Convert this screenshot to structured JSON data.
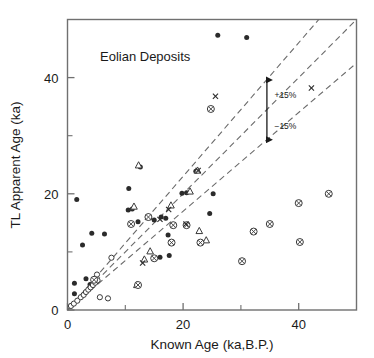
{
  "chart_data": {
    "type": "scatter",
    "title": "Eolian Deposits",
    "xlabel": "Known Age (ka,B.P.)",
    "ylabel": "TL Apparent Age (ka)",
    "xlim": [
      0,
      50
    ],
    "ylim": [
      0,
      50
    ],
    "xticks": [
      0,
      20,
      40
    ],
    "xticklabels": [
      "0",
      "20",
      "40"
    ],
    "xminorticks": [
      10,
      30
    ],
    "yticks": [
      0,
      20,
      40
    ],
    "yticklabels": [
      "0",
      "20",
      "40"
    ],
    "yminorticks": [
      10,
      30
    ],
    "grid": false,
    "legend": "none",
    "reference_lines": [
      {
        "name": "one-to-one",
        "slope": 1.0,
        "intercept": 0,
        "style": "dashed"
      },
      {
        "name": "plus-15-percent",
        "slope": 1.15,
        "intercept": 0,
        "style": "dashed"
      },
      {
        "name": "minus-15-percent",
        "slope": 0.85,
        "intercept": 0,
        "style": "dashed"
      }
    ],
    "annotations": [
      {
        "name": "plus-15-label",
        "text": "+15%",
        "x": 35.8,
        "y": 36.5
      },
      {
        "name": "minus-15-label",
        "text": "−15%",
        "x": 35.8,
        "y": 31.2
      },
      {
        "name": "error-arrow",
        "text": "",
        "x": 34.5,
        "y_top": 39.6,
        "y_bottom": 29.3
      }
    ],
    "series": [
      {
        "name": "filled-circle",
        "marker": "filled-circle",
        "points": [
          [
            1.2,
            4.6
          ],
          [
            1.2,
            2.8
          ],
          [
            1.6,
            19.0
          ],
          [
            2.6,
            11.2
          ],
          [
            3.2,
            5.4
          ],
          [
            3.9,
            4.4
          ],
          [
            4.4,
            4.4
          ],
          [
            4.2,
            13.2
          ],
          [
            6.4,
            13.1
          ],
          [
            10.6,
            20.9
          ],
          [
            10.5,
            17.2
          ],
          [
            11.2,
            17.4
          ],
          [
            12.2,
            15.2
          ],
          [
            12.6,
            24.6
          ],
          [
            15.0,
            15.5
          ],
          [
            16.2,
            16.0
          ],
          [
            17.0,
            15.8
          ],
          [
            17.4,
            12.9
          ],
          [
            16.0,
            9.1
          ],
          [
            17.6,
            9.4
          ],
          [
            19.8,
            20.1
          ],
          [
            20.6,
            20.2
          ],
          [
            22.2,
            23.9
          ],
          [
            24.6,
            16.6
          ],
          [
            25.2,
            20.0
          ],
          [
            26.0,
            47.3
          ],
          [
            31.0,
            46.9
          ]
        ]
      },
      {
        "name": "open-circle",
        "marker": "open-circle",
        "points": [
          [
            0.6,
            0.7
          ],
          [
            1.1,
            1.1
          ],
          [
            1.7,
            1.6
          ],
          [
            2.3,
            2.2
          ],
          [
            2.8,
            2.6
          ],
          [
            3.2,
            3.1
          ],
          [
            3.6,
            3.5
          ],
          [
            4.0,
            3.9
          ],
          [
            4.4,
            4.3
          ],
          [
            4.8,
            4.7
          ],
          [
            5.2,
            5.1
          ],
          [
            5.1,
            6.1
          ],
          [
            5.6,
            2.2
          ],
          [
            7.0,
            2.0
          ],
          [
            7.6,
            9.0
          ]
        ]
      },
      {
        "name": "open-triangle",
        "marker": "open-triangle",
        "points": [
          [
            11.5,
            17.8
          ],
          [
            12.3,
            24.9
          ],
          [
            14.0,
            16.0
          ],
          [
            13.3,
            8.7
          ],
          [
            14.3,
            10.1
          ],
          [
            17.9,
            18.0
          ],
          [
            21.2,
            20.4
          ],
          [
            22.5,
            24.0
          ],
          [
            22.8,
            13.6
          ],
          [
            24.0,
            12.0
          ],
          [
            12.0,
            4.3
          ]
        ]
      },
      {
        "name": "crossed-circle",
        "marker": "crossed-circle",
        "points": [
          [
            4.6,
            5.2
          ],
          [
            11.0,
            14.8
          ],
          [
            12.2,
            4.3
          ],
          [
            14.0,
            16.0
          ],
          [
            15.0,
            8.9
          ],
          [
            18.0,
            11.6
          ],
          [
            18.3,
            14.6
          ],
          [
            20.6,
            14.6
          ],
          [
            23.0,
            11.6
          ],
          [
            24.8,
            34.6
          ],
          [
            30.2,
            8.4
          ],
          [
            32.2,
            13.5
          ],
          [
            35.0,
            14.8
          ],
          [
            40.0,
            18.4
          ],
          [
            40.2,
            11.7
          ],
          [
            45.2,
            20.0
          ]
        ]
      },
      {
        "name": "x-mark",
        "marker": "x",
        "points": [
          [
            13.0,
            8.1
          ],
          [
            16.0,
            15.6
          ],
          [
            17.5,
            17.3
          ],
          [
            20.5,
            14.8
          ],
          [
            22.6,
            24.0
          ],
          [
            42.2,
            38.2
          ],
          [
            25.6,
            36.8
          ]
        ]
      }
    ]
  }
}
